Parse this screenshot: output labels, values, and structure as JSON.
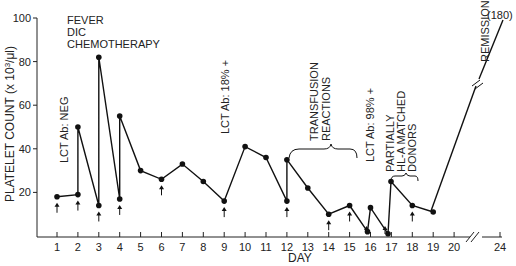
{
  "chart_data": {
    "type": "line",
    "title": "",
    "xlabel": "DAY",
    "ylabel": "PLATELET COUNT (x 10³/μl)",
    "ylim": [
      0,
      100
    ],
    "yticks": [
      20,
      40,
      60,
      80,
      100
    ],
    "xticks": [
      1,
      2,
      3,
      4,
      5,
      6,
      7,
      8,
      9,
      10,
      11,
      12,
      13,
      14,
      15,
      16,
      17,
      18,
      19,
      20,
      24
    ],
    "x_axis_break": "between 20 and 24",
    "grid": false,
    "legend": null,
    "series": [
      {
        "name": "Platelet count",
        "points": [
          {
            "day": 1,
            "value": 18
          },
          {
            "day": 2,
            "value": 19
          },
          {
            "day": 2,
            "value": 50
          },
          {
            "day": 3,
            "value": 14
          },
          {
            "day": 3,
            "value": 82
          },
          {
            "day": 4,
            "value": 17
          },
          {
            "day": 4,
            "value": 55
          },
          {
            "day": 5,
            "value": 30
          },
          {
            "day": 6,
            "value": 26
          },
          {
            "day": 7,
            "value": 33
          },
          {
            "day": 8,
            "value": 25
          },
          {
            "day": 9,
            "value": 16
          },
          {
            "day": 10,
            "value": 41
          },
          {
            "day": 11,
            "value": 36
          },
          {
            "day": 12,
            "value": 16
          },
          {
            "day": 12,
            "value": 35
          },
          {
            "day": 13,
            "value": 22
          },
          {
            "day": 14,
            "value": 10
          },
          {
            "day": 15,
            "value": 14
          },
          {
            "day": 16,
            "value": 2
          },
          {
            "day": 16,
            "value": 13
          },
          {
            "day": 16.9,
            "value": 1
          },
          {
            "day": 17,
            "value": 25
          },
          {
            "day": 18,
            "value": 14
          },
          {
            "day": 19,
            "value": 11
          },
          {
            "day": 24,
            "value": 180
          }
        ]
      }
    ],
    "transfusion_arrows_days": [
      1,
      2,
      3,
      4,
      6,
      9,
      12,
      14,
      15,
      16,
      16.9,
      18
    ],
    "annotations": [
      {
        "text": "FEVER",
        "day": 2,
        "value": 97
      },
      {
        "text": "DIC",
        "day": 2,
        "value": 92
      },
      {
        "text": "CHEMOTHERAPY",
        "day": 2,
        "value": 87
      },
      {
        "text": "LCT Ab: NEG",
        "orientation": "vertical",
        "day": 1.2
      },
      {
        "text": "LCT Ab: 18% +",
        "orientation": "vertical",
        "day": 9
      },
      {
        "text": "TRANSFUSION REACTIONS",
        "orientation": "vertical",
        "bracket_days": [
          12,
          15
        ]
      },
      {
        "text": "LCT Ab: 98% +",
        "orientation": "vertical",
        "day": 16
      },
      {
        "text": "PARTIALLY HL-A MATCHED DONORS",
        "orientation": "vertical",
        "bracket_days": [
          17,
          18
        ]
      },
      {
        "text": "REMISSION",
        "orientation": "vertical",
        "day": 22
      },
      {
        "text": "(180)",
        "day": 24,
        "value": 180
      }
    ]
  },
  "labels": {
    "y_title": "PLATELET COUNT (x 10",
    "y_title_sup": "3",
    "y_title_end": "/μl)",
    "x_title": "DAY",
    "fever": "FEVER",
    "dic": "DIC",
    "chemo": "CHEMOTHERAPY",
    "lct_neg": "LCT Ab:  NEG",
    "lct_18": "LCT Ab:  18% +",
    "transfusion1": "TRANSFUSION",
    "transfusion2": "REACTIONS",
    "lct_98": "LCT Ab:  98% +",
    "partially1": "PARTIALLY",
    "partially2": "HL-A MATCHED",
    "partially3": "DONORS",
    "remission": "REMISSION",
    "remission_value": "(180)"
  }
}
